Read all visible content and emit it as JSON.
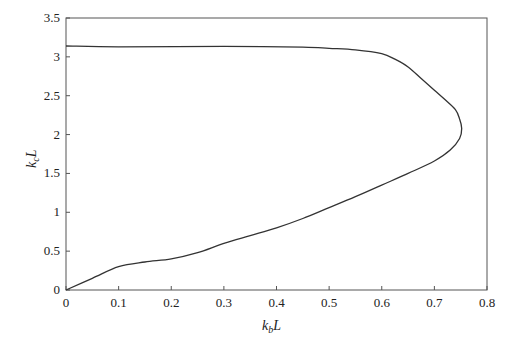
{
  "chart_data": {
    "type": "line",
    "title": "",
    "xlabel": "k_bL",
    "ylabel": "k_cL",
    "xlim": [
      0,
      0.8
    ],
    "ylim": [
      0,
      3.5
    ],
    "grid": false,
    "legend": null,
    "x_ticks": [
      "0",
      "0.1",
      "0.2",
      "0.3",
      "0.4",
      "0.5",
      "0.6",
      "0.7",
      "0.8"
    ],
    "y_ticks": [
      "0",
      "0.5",
      "1",
      "1.5",
      "2",
      "2.5",
      "3",
      "3.5"
    ],
    "series": [
      {
        "name": "dispersion curve",
        "points": [
          [
            0.0,
            0.0
          ],
          [
            0.05,
            0.15
          ],
          [
            0.1,
            0.3
          ],
          [
            0.15,
            0.36
          ],
          [
            0.2,
            0.4
          ],
          [
            0.25,
            0.48
          ],
          [
            0.3,
            0.6
          ],
          [
            0.35,
            0.7
          ],
          [
            0.4,
            0.8
          ],
          [
            0.45,
            0.92
          ],
          [
            0.5,
            1.06
          ],
          [
            0.55,
            1.2
          ],
          [
            0.6,
            1.35
          ],
          [
            0.65,
            1.5
          ],
          [
            0.7,
            1.66
          ],
          [
            0.73,
            1.8
          ],
          [
            0.748,
            1.95
          ],
          [
            0.752,
            2.08
          ],
          [
            0.748,
            2.2
          ],
          [
            0.74,
            2.32
          ],
          [
            0.72,
            2.45
          ],
          [
            0.7,
            2.57
          ],
          [
            0.675,
            2.72
          ],
          [
            0.65,
            2.87
          ],
          [
            0.625,
            2.97
          ],
          [
            0.6,
            3.04
          ],
          [
            0.55,
            3.09
          ],
          [
            0.5,
            3.11
          ],
          [
            0.45,
            3.125
          ],
          [
            0.3,
            3.135
          ],
          [
            0.1,
            3.13
          ],
          [
            0.0,
            3.14
          ]
        ]
      }
    ]
  },
  "labels": {
    "x_axis_main": "k",
    "x_axis_sub": "b",
    "x_axis_tail": "L",
    "y_axis_main": "k",
    "y_axis_sub": "c",
    "y_axis_tail": "L"
  }
}
